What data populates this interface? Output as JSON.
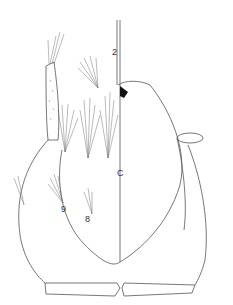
{
  "figure": {
    "labels": {
      "seta_2": "2",
      "clypeus": "C",
      "seta_9": "9",
      "seta_8": "8"
    },
    "colors": {
      "line": "#555555",
      "fill_black": "#111111",
      "background": "#ffffff"
    }
  }
}
